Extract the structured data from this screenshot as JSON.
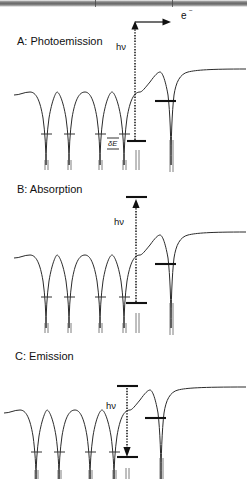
{
  "figure": {
    "type": "scientific-schematic",
    "width": 247,
    "height": 479,
    "background": "#ffffff",
    "line_color": "#2b2b2b"
  },
  "panels": [
    {
      "id": "A",
      "label": "A:  Photoemission",
      "photon_label": "hν",
      "electron_label": "e",
      "electron_superscript": "−",
      "splitting_label": "δE",
      "arrow_direction": "up-then-right",
      "arrow_style": "dotted",
      "transition": "core level to above vacuum level, electron ejected"
    },
    {
      "id": "B",
      "label": "B:  Absorption",
      "photon_label": "hν",
      "arrow_direction": "up",
      "arrow_style": "dotted",
      "transition": "core level to unoccupied bound state below vacuum"
    },
    {
      "id": "C",
      "label": "C:  Emission",
      "photon_label": "hν",
      "arrow_direction": "down",
      "arrow_style": "dotted",
      "transition": "upper level down to core hole, photon emitted"
    }
  ],
  "potential": {
    "bulk_well_count": 5,
    "surface_well_count": 1,
    "bulk_well_peaks_x": [
      30,
      57,
      85,
      112,
      140
    ],
    "surface_well_peak_x": 160,
    "vacuum_plateau_start_x": 176,
    "vacuum_plateau_end_x": 247,
    "core_level_marks": "short horizontal bars at bottom of each well",
    "surface_level_mark": "horizontal bar partway up the surface well"
  },
  "artifact": {
    "top_scan_band": true,
    "top_scan_band_height_px": 7
  }
}
